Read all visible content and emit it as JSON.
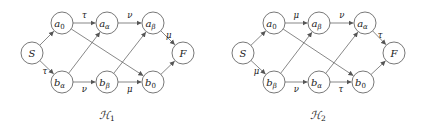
{
  "diagrams": [
    {
      "caption": "ℋ",
      "caption_sub": "1",
      "nodes": {
        "S": {
          "label": "S",
          "sub": "",
          "x": 32,
          "y": 53
        },
        "a0": {
          "label": "a",
          "sub": "0",
          "x": 62,
          "y": 23
        },
        "aa": {
          "label": "a",
          "sub": "α",
          "x": 107,
          "y": 23
        },
        "ab": {
          "label": "a",
          "sub": "β",
          "x": 153,
          "y": 23
        },
        "ba": {
          "label": "b",
          "sub": "α",
          "x": 62,
          "y": 82
        },
        "bb": {
          "label": "b",
          "sub": "β",
          "x": 107,
          "y": 82
        },
        "b0": {
          "label": "b",
          "sub": "0",
          "x": 153,
          "y": 82
        },
        "F": {
          "label": "F",
          "sub": "",
          "x": 183,
          "y": 53
        }
      },
      "edges": [
        {
          "from": "S",
          "to": "a0",
          "label": ""
        },
        {
          "from": "S",
          "to": "ba",
          "label": "τ"
        },
        {
          "from": "a0",
          "to": "aa",
          "label": "τ"
        },
        {
          "from": "aa",
          "to": "ab",
          "label": "ν"
        },
        {
          "from": "ab",
          "to": "F",
          "label": "μ"
        },
        {
          "from": "ba",
          "to": "bb",
          "label": "ν"
        },
        {
          "from": "bb",
          "to": "b0",
          "label": "μ"
        },
        {
          "from": "b0",
          "to": "F",
          "label": ""
        },
        {
          "from": "a0",
          "to": "b0",
          "label": ""
        },
        {
          "from": "ba",
          "to": "aa",
          "label": ""
        },
        {
          "from": "bb",
          "to": "ab",
          "label": ""
        }
      ]
    },
    {
      "caption": "ℋ",
      "caption_sub": "2",
      "nodes": {
        "S": {
          "label": "S",
          "sub": "",
          "x": 243,
          "y": 53
        },
        "a0": {
          "label": "a",
          "sub": "0",
          "x": 274,
          "y": 23
        },
        "ab": {
          "label": "a",
          "sub": "β",
          "x": 319,
          "y": 23
        },
        "aa": {
          "label": "a",
          "sub": "α",
          "x": 365,
          "y": 23
        },
        "bb": {
          "label": "b",
          "sub": "β",
          "x": 274,
          "y": 82
        },
        "ba": {
          "label": "b",
          "sub": "α",
          "x": 319,
          "y": 82
        },
        "b0": {
          "label": "b",
          "sub": "0",
          "x": 363,
          "y": 82
        },
        "F": {
          "label": "F",
          "sub": "",
          "x": 394,
          "y": 53
        }
      },
      "edges": [
        {
          "from": "S",
          "to": "a0",
          "label": ""
        },
        {
          "from": "S",
          "to": "bb",
          "label": "μ"
        },
        {
          "from": "a0",
          "to": "ab",
          "label": "μ"
        },
        {
          "from": "ab",
          "to": "aa",
          "label": "ν"
        },
        {
          "from": "aa",
          "to": "F",
          "label": "τ"
        },
        {
          "from": "bb",
          "to": "ba",
          "label": "ν"
        },
        {
          "from": "ba",
          "to": "b0",
          "label": "τ"
        },
        {
          "from": "b0",
          "to": "F",
          "label": ""
        },
        {
          "from": "a0",
          "to": "b0",
          "label": ""
        },
        {
          "from": "bb",
          "to": "ab",
          "label": ""
        },
        {
          "from": "ba",
          "to": "aa",
          "label": ""
        }
      ]
    }
  ]
}
